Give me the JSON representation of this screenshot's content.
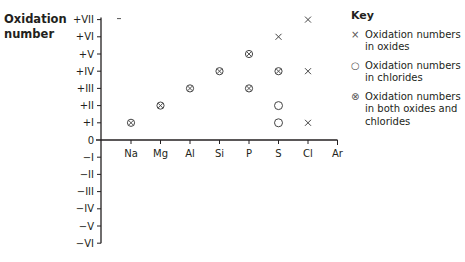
{
  "chart_data": {
    "type": "scatter",
    "title": "",
    "ylabel": "Oxidation number",
    "xlabel": "",
    "categories": [
      "Na",
      "Mg",
      "Al",
      "Si",
      "P",
      "S",
      "Cl",
      "Ar"
    ],
    "y_tick_labels": [
      "+VII",
      "+VI",
      "+V",
      "+IV",
      "+III",
      "+II",
      "+I",
      "0",
      "-I",
      "-II",
      "-III",
      "-IV",
      "-V",
      "-VI"
    ],
    "ylim": [
      -6,
      7
    ],
    "grid": false,
    "legend_position": "right",
    "series": [
      {
        "name": "Oxidation numbers in oxides",
        "marker": "x",
        "points": [
          {
            "x": "S",
            "y": 6
          },
          {
            "x": "Cl",
            "y": 7
          },
          {
            "x": "Cl",
            "y": 4
          },
          {
            "x": "Cl",
            "y": 1
          }
        ]
      },
      {
        "name": "Oxidation numbers in chlorides",
        "marker": "o",
        "points": [
          {
            "x": "S",
            "y": 2
          },
          {
            "x": "S",
            "y": 1
          }
        ]
      },
      {
        "name": "Oxidation numbers in both oxides and chlorides",
        "marker": "otimes",
        "points": [
          {
            "x": "Na",
            "y": 1
          },
          {
            "x": "Mg",
            "y": 2
          },
          {
            "x": "Al",
            "y": 3
          },
          {
            "x": "Si",
            "y": 4
          },
          {
            "x": "P",
            "y": 5
          },
          {
            "x": "P",
            "y": 3
          },
          {
            "x": "S",
            "y": 4
          }
        ]
      }
    ],
    "annotations": [
      {
        "text": "–",
        "x_between": "axis-Na",
        "y": 7
      }
    ]
  },
  "axis": {
    "title_line1": "Oxidation",
    "title_line2": "number"
  },
  "key": {
    "title": "Key",
    "items": [
      {
        "symbol": "×",
        "label": "Oxidation numbers in oxides"
      },
      {
        "symbol": "○",
        "label": "Oxidation numbers in chlorides"
      },
      {
        "symbol": "⊗",
        "label": "Oxidation numbers in both oxides and chlorides"
      }
    ]
  }
}
